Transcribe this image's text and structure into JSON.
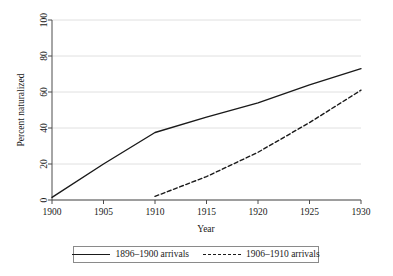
{
  "chart_data": {
    "type": "line",
    "title": "",
    "xlabel": "Year",
    "ylabel": "Percent naturalized",
    "xlim": [
      1900,
      1930
    ],
    "ylim": [
      0,
      100
    ],
    "xticks": [
      1900,
      1905,
      1910,
      1915,
      1920,
      1925,
      1930
    ],
    "yticks": [
      0,
      20,
      40,
      60,
      80,
      100
    ],
    "xtick_labels": [
      "1900",
      "1905",
      "1910",
      "1915",
      "1920",
      "1925",
      "1930"
    ],
    "ytick_labels": [
      "0",
      "20",
      "40",
      "60",
      "80",
      "100"
    ],
    "grid": "horizontal",
    "legend_position": "below",
    "series": [
      {
        "name": "1896–1900 arrivals",
        "style": "solid",
        "color": "#1a1a1a",
        "x": [
          1900,
          1905,
          1910,
          1915,
          1920,
          1925,
          1930
        ],
        "values": [
          1.5,
          20,
          37.5,
          46,
          54,
          64,
          73
        ]
      },
      {
        "name": "1906–1910 arrivals",
        "style": "dashed",
        "color": "#1a1a1a",
        "x": [
          1910,
          1915,
          1920,
          1925,
          1930
        ],
        "values": [
          2,
          13,
          26.5,
          43,
          61
        ]
      }
    ]
  },
  "legend": {
    "entries": [
      {
        "label": "1896–1900 arrivals",
        "style": "solid"
      },
      {
        "label": "1906–1910 arrivals",
        "style": "dashed"
      }
    ]
  }
}
